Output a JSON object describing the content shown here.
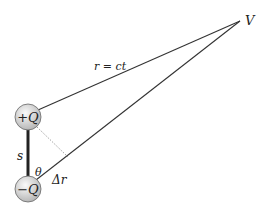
{
  "diagram": {
    "title": "",
    "points": {
      "V": {
        "label": "V",
        "x": 240,
        "y": 21
      },
      "plus_charge": {
        "label": "+Q",
        "x": 28,
        "y": 117,
        "r": 13
      },
      "minus_charge": {
        "label": "−Q",
        "x": 28,
        "y": 189,
        "r": 13
      },
      "perp_foot": {
        "x": 68,
        "y": 160
      }
    },
    "labels": {
      "distance": "r = ct",
      "separation": "s",
      "angle": "θ",
      "path_difference": "Δr",
      "point": "V",
      "plus": "+Q",
      "minus": "−Q"
    },
    "colors": {
      "line": "#333333",
      "rod": "#222222",
      "dotted": "#888888",
      "charge_fill_light": "#f4f4f4",
      "charge_fill_dark": "#b8b8b8"
    }
  }
}
